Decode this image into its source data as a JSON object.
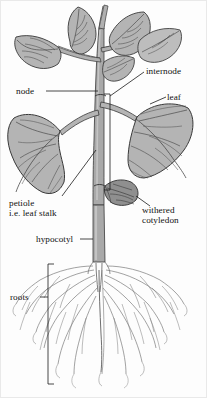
{
  "figure": {
    "style": "grayscale line drawing with shaded fills",
    "width": 207,
    "height": 414
  },
  "labels": {
    "node": "node",
    "internode": "internode",
    "leaf": "leaf",
    "petiole_line1": "petiole",
    "petiole_line2": "i.e. leaf stalk",
    "withered_line1": "withered",
    "withered_line2": "cotyledon",
    "hypocotyl": "hypocotyl",
    "roots": "roots"
  },
  "colors": {
    "leaf_fill": "#b4b4b4",
    "leaf_fill_light": "#c6c6c6",
    "stem_fill": "#a9a9a9",
    "stem_fill_light": "#bdbdbd",
    "cotyledon_fill": "#8f8f8f",
    "outline": "#3a3a3a",
    "vein": "#4a4a4a",
    "root_line": "#7a7a7a",
    "leader": "#1a1a1a",
    "text": "#111111",
    "background": "#fdfdfd",
    "border": "#e9e9e9"
  },
  "parts": [
    {
      "name": "leaf",
      "count": 5,
      "description": "broad ovate shaded leaves with branching veins"
    },
    {
      "name": "node",
      "description": "point on stem where leaves attach"
    },
    {
      "name": "internode",
      "description": "stem segment between two nodes"
    },
    {
      "name": "petiole",
      "description": "leaf stalk joining blade to stem"
    },
    {
      "name": "withered cotyledon",
      "description": "shrivelled seed leaf on lower stem"
    },
    {
      "name": "hypocotyl",
      "description": "stem region below cotyledons above roots"
    },
    {
      "name": "roots",
      "description": "fibrous branching root system"
    }
  ]
}
